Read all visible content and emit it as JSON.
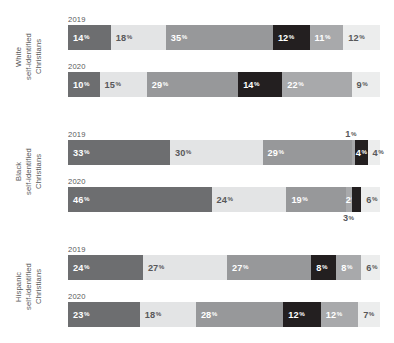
{
  "chart_data": {
    "type": "bar",
    "subtype": "stacked-100-horizontal",
    "title": "",
    "xlabel": "",
    "ylabel": "",
    "xlim": [
      0,
      100
    ],
    "grid": false,
    "legend_position": "none",
    "value_suffix": "%",
    "palette": {
      "s1": "#6d6e70",
      "s2": "#e3e4e5",
      "s3": "#97989a",
      "s4": "#231f20",
      "s5": "#a8a9ab",
      "s6": "#eceded",
      "s7": "#d3d4d5"
    },
    "groups": [
      {
        "label": "White\nself-identified\nChristians",
        "rows": [
          {
            "year": "2019",
            "segments": [
              {
                "value": 14,
                "label": "14",
                "color_key": "s1",
                "text": "dark",
                "align": "left"
              },
              {
                "value": 18,
                "label": "18",
                "color_key": "s2",
                "text": "light",
                "align": "left"
              },
              {
                "value": 35,
                "label": "35",
                "color_key": "s3",
                "text": "dark",
                "align": "left"
              },
              {
                "value": 12,
                "label": "12",
                "color_key": "s4",
                "text": "dark",
                "align": "left"
              },
              {
                "value": 11,
                "label": "11",
                "color_key": "s5",
                "text": "dark",
                "align": "left"
              },
              {
                "value": 12,
                "label": "12",
                "color_key": "s6",
                "text": "light",
                "align": "left"
              }
            ]
          },
          {
            "year": "2020",
            "segments": [
              {
                "value": 10,
                "label": "10",
                "color_key": "s1",
                "text": "dark",
                "align": "left"
              },
              {
                "value": 15,
                "label": "15",
                "color_key": "s2",
                "text": "light",
                "align": "left"
              },
              {
                "value": 29,
                "label": "29",
                "color_key": "s3",
                "text": "dark",
                "align": "left"
              },
              {
                "value": 14,
                "label": "14",
                "color_key": "s4",
                "text": "dark",
                "align": "left"
              },
              {
                "value": 22,
                "label": "22",
                "color_key": "s5",
                "text": "dark",
                "align": "left"
              },
              {
                "value": 9,
                "label": "9",
                "color_key": "s6",
                "text": "light",
                "align": "left"
              }
            ]
          }
        ]
      },
      {
        "label": "Black\nself-identified\nChristians",
        "rows": [
          {
            "year": "2019",
            "segments": [
              {
                "value": 33,
                "label": "33",
                "color_key": "s1",
                "text": "dark",
                "align": "left"
              },
              {
                "value": 30,
                "label": "30",
                "color_key": "s2",
                "text": "light",
                "align": "left"
              },
              {
                "value": 29,
                "label": "29",
                "color_key": "s3",
                "text": "dark",
                "align": "left"
              },
              {
                "value": 1,
                "label": "1",
                "color_key": "s5",
                "text": "light",
                "align": "left",
                "callout": "above"
              },
              {
                "value": 4,
                "label": "4",
                "color_key": "s4",
                "text": "dark",
                "align": "center"
              },
              {
                "value": 4,
                "label": "4",
                "color_key": "s6",
                "text": "light",
                "align": "left"
              }
            ]
          },
          {
            "year": "2020",
            "segments": [
              {
                "value": 46,
                "label": "46",
                "color_key": "s1",
                "text": "dark",
                "align": "left"
              },
              {
                "value": 24,
                "label": "24",
                "color_key": "s2",
                "text": "light",
                "align": "left"
              },
              {
                "value": 19,
                "label": "19",
                "color_key": "s3",
                "text": "dark",
                "align": "left"
              },
              {
                "value": 2,
                "label": "2",
                "color_key": "s5",
                "text": "dark",
                "align": "center"
              },
              {
                "value": 3,
                "label": "3",
                "color_key": "s4",
                "text": "dark",
                "align": "left",
                "callout": "below"
              },
              {
                "value": 6,
                "label": "6",
                "color_key": "s6",
                "text": "light",
                "align": "left"
              }
            ]
          }
        ]
      },
      {
        "label": "Hispanic\nself-identified\nChristians",
        "rows": [
          {
            "year": "2019",
            "segments": [
              {
                "value": 24,
                "label": "24",
                "color_key": "s1",
                "text": "dark",
                "align": "left"
              },
              {
                "value": 27,
                "label": "27",
                "color_key": "s2",
                "text": "light",
                "align": "left"
              },
              {
                "value": 27,
                "label": "27",
                "color_key": "s3",
                "text": "dark",
                "align": "left"
              },
              {
                "value": 8,
                "label": "8",
                "color_key": "s4",
                "text": "dark",
                "align": "left"
              },
              {
                "value": 8,
                "label": "8",
                "color_key": "s5",
                "text": "dark",
                "align": "left"
              },
              {
                "value": 6,
                "label": "6",
                "color_key": "s6",
                "text": "light",
                "align": "left"
              }
            ]
          },
          {
            "year": "2020",
            "segments": [
              {
                "value": 23,
                "label": "23",
                "color_key": "s1",
                "text": "dark",
                "align": "left"
              },
              {
                "value": 18,
                "label": "18",
                "color_key": "s2",
                "text": "light",
                "align": "left"
              },
              {
                "value": 28,
                "label": "28",
                "color_key": "s3",
                "text": "dark",
                "align": "left"
              },
              {
                "value": 12,
                "label": "12",
                "color_key": "s4",
                "text": "dark",
                "align": "left"
              },
              {
                "value": 12,
                "label": "12",
                "color_key": "s5",
                "text": "dark",
                "align": "left"
              },
              {
                "value": 7,
                "label": "7",
                "color_key": "s6",
                "text": "light",
                "align": "left"
              }
            ]
          }
        ]
      }
    ]
  }
}
